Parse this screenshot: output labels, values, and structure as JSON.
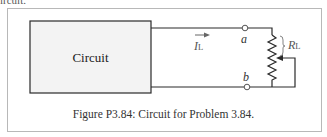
{
  "clipped_text": "ircuit.",
  "figure": {
    "block_label": "Circuit",
    "current_label": "I",
    "current_subscript": "L",
    "terminal_a": "a",
    "terminal_b": "b",
    "load_label": "R",
    "load_subscript": "L",
    "caption": "Figure P3.84: Circuit for Problem 3.84."
  },
  "colors": {
    "wire": "#2a2a2a",
    "block_fill": "#f3f3f3",
    "caption": "#333333",
    "label": "#555555",
    "frame": "#b8b8b8"
  }
}
